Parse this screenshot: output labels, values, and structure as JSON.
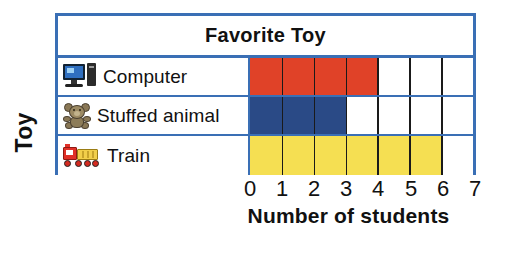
{
  "chart_data": {
    "type": "bar",
    "orientation": "horizontal",
    "title": "Favorite Toy",
    "xlabel": "Number of students",
    "ylabel": "Toy",
    "categories": [
      "Computer",
      "Stuffed animal",
      "Train"
    ],
    "values": [
      4,
      3,
      6
    ],
    "bar_colors": [
      "#e04228",
      "#2a4a86",
      "#f5df52"
    ],
    "category_icons": [
      "computer-icon",
      "teddy-bear-icon",
      "train-icon"
    ],
    "xlim": [
      0,
      7
    ],
    "xticks": [
      "0",
      "1",
      "2",
      "3",
      "4",
      "5",
      "6",
      "7"
    ],
    "grid": true,
    "legend": "none",
    "frame_color": "#3a6fb5",
    "gridline_color": "#1a1a1a",
    "background": "#ffffff"
  }
}
